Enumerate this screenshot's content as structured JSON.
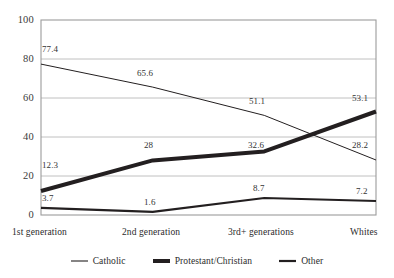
{
  "chart_data": {
    "type": "line",
    "title": "",
    "xlabel": "",
    "ylabel": "",
    "categories": [
      "1st generation",
      "2nd generation",
      "3rd+ generations",
      "Whites"
    ],
    "ylim": [
      0,
      100
    ],
    "yticks": [
      0,
      20,
      40,
      60,
      80,
      100
    ],
    "ytick_labels": [
      "0",
      "20",
      "40",
      "60",
      "80",
      "100"
    ],
    "grid": "horizontal",
    "legend_position": "bottom",
    "series": [
      {
        "name": "Catholic",
        "values": [
          77.4,
          65.6,
          51.1,
          28.2
        ],
        "labels": [
          "77.4",
          "65.6",
          "51.1",
          "28.2"
        ],
        "color": "#231f20",
        "line_width": 1
      },
      {
        "name": "Protestant/Christian",
        "values": [
          12.3,
          28,
          32.6,
          53.1
        ],
        "labels": [
          "12.3",
          "28",
          "32.6",
          "53.1"
        ],
        "color": "#231f20",
        "line_width": 4
      },
      {
        "name": "Other",
        "values": [
          3.7,
          1.6,
          8.7,
          7.2
        ],
        "labels": [
          "3.7",
          "1.6",
          "8.7",
          "7.2"
        ],
        "color": "#231f20",
        "line_width": 2.2
      }
    ]
  },
  "axis": {
    "y_labels": {
      "t100": "100",
      "t80": "80",
      "t60": "60",
      "t40": "40",
      "t20": "20",
      "t0": "0"
    },
    "x_labels": {
      "c0": "1st generation",
      "c1": "2nd generation",
      "c2": "3rd+ generations",
      "c3": "Whites"
    }
  },
  "labels": {
    "catholic": {
      "p0": "77.4",
      "p1": "65.6",
      "p2": "51.1",
      "p3": "28.2"
    },
    "protestant": {
      "p0": "12.3",
      "p1": "28",
      "p2": "32.6",
      "p3": "53.1"
    },
    "other": {
      "p0": "3.7",
      "p1": "1.6",
      "p2": "8.7",
      "p3": "7.2"
    }
  },
  "legend": {
    "catholic": "Catholic",
    "protestant": "Protestant/Christian",
    "other": "Other"
  },
  "colors": {
    "ink": "#231f20",
    "grid": "#b9b9b9",
    "frame": "#9c9c9c",
    "background": "#ffffff"
  }
}
